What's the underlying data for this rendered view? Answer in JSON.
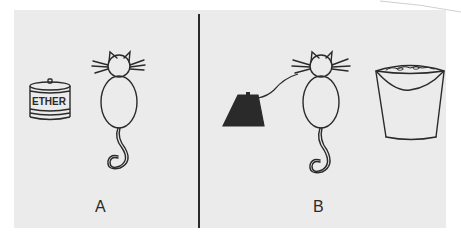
{
  "figure": {
    "colors": {
      "background": "#ebebeb",
      "ink": "#2a2a2a",
      "border": "#ffffff"
    },
    "panels": [
      {
        "id": "A",
        "label": "A",
        "objects": [
          {
            "type": "can",
            "text": "ETHER"
          },
          {
            "type": "cat",
            "view": "from behind, sitting"
          }
        ]
      },
      {
        "id": "B",
        "label": "B",
        "objects": [
          {
            "type": "black-block",
            "shape": "trapezoid",
            "connected_to": "cat"
          },
          {
            "type": "cat",
            "view": "from behind, sitting"
          },
          {
            "type": "bucket",
            "contents": "filled"
          }
        ]
      }
    ]
  }
}
